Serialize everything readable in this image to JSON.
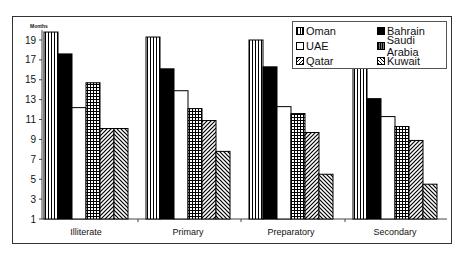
{
  "chart_data": {
    "type": "bar",
    "title": "",
    "xlabel": "",
    "ylabel": "Months",
    "ylim": [
      1,
      20
    ],
    "yticks": [
      1,
      3,
      5,
      7,
      9,
      11,
      13,
      15,
      17,
      19
    ],
    "categories": [
      "Illiterate",
      "Primary",
      "Preparatory",
      "Secondary"
    ],
    "series": [
      {
        "name": "Oman",
        "pattern": "vertical-stripes",
        "values": [
          19.8,
          19.3,
          19.0,
          16.5
        ]
      },
      {
        "name": "Bahrain",
        "pattern": "solid-black",
        "values": [
          17.6,
          16.1,
          16.3,
          13.1
        ]
      },
      {
        "name": "UAE",
        "pattern": "white",
        "values": [
          12.2,
          13.9,
          12.3,
          11.3
        ]
      },
      {
        "name": "Saudi Arabia",
        "pattern": "grid",
        "values": [
          14.7,
          12.1,
          11.6,
          10.3
        ]
      },
      {
        "name": "Qatar",
        "pattern": "diagonal-up",
        "values": [
          10.1,
          10.9,
          9.7,
          8.9
        ]
      },
      {
        "name": "Kuwait",
        "pattern": "diagonal-down",
        "values": [
          10.1,
          7.8,
          5.5,
          4.5
        ]
      }
    ],
    "legend_position": "top-right",
    "grid": false
  },
  "legend": {
    "items": [
      "Oman",
      "Bahrain",
      "UAE",
      "Saudi Arabia",
      "Qatar",
      "Kuwait"
    ]
  },
  "axis": {
    "unit_label": "Months"
  }
}
